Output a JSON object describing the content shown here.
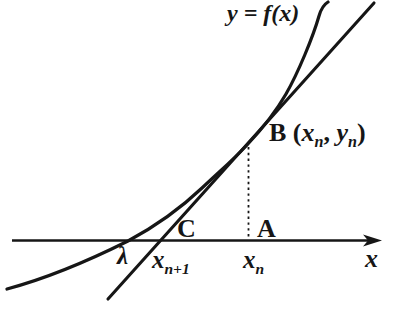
{
  "figure": {
    "background": "#ffffff",
    "ink": "#161616",
    "curve_label": "y = f(x)",
    "point_b": {
      "name": "B",
      "open": "(",
      "x_base": "x",
      "x_sub": "n",
      "sep": ", ",
      "y_base": "y",
      "y_sub": "n",
      "close": ")"
    },
    "point_c": "C",
    "point_a": "A",
    "lambda": "λ",
    "x_next": {
      "base": "x",
      "sub": "n+1"
    },
    "x_curr": {
      "base": "x",
      "sub": "n"
    },
    "axis_label": "x"
  }
}
